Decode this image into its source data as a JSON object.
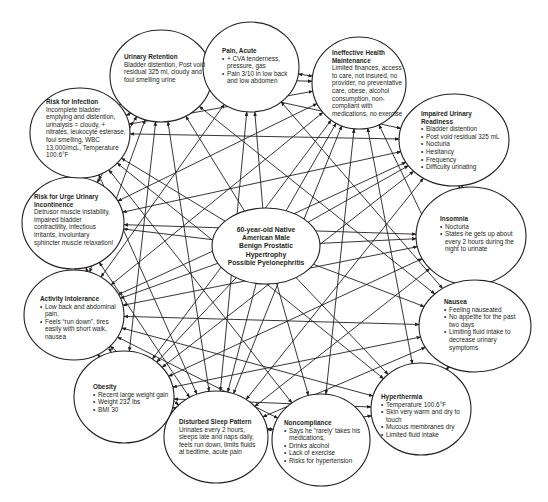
{
  "diagram": {
    "type": "concept-map",
    "center": {
      "lines": [
        "60-year-old Native",
        "American Male",
        "Benign Prostatic",
        "Hypertrophy",
        "Possible Pyelonephritis"
      ],
      "cx": 266,
      "cy": 246,
      "rx": 54,
      "ry": 38
    },
    "nodes": [
      {
        "id": "urinary-retention",
        "title": "Urinary Retention",
        "description": "Bladder distention, Post void residual 325 ml, cloudy and foul smelling urine",
        "bullets": [],
        "cx": 161,
        "cy": 76,
        "rx": 51,
        "ry": 46,
        "tx": 124,
        "ty": 53,
        "tw": 82
      },
      {
        "id": "pain-acute",
        "title": "Pain, Acute",
        "description": "",
        "bullets": [
          "+ CVA tenderness, pressure, gas",
          "Pain 3/10 in low back and low abdomen"
        ],
        "cx": 251,
        "cy": 67,
        "rx": 48,
        "ry": 45,
        "tx": 222,
        "ty": 47,
        "tw": 74
      },
      {
        "id": "ineffective-health-maintenance",
        "title": "Ineffective Health Maintenance",
        "description": "Limited finances, access to care, not insured, no provider, no preventative care, obese, alcohol consumption, non-compliant with medications, no exercise",
        "bullets": [],
        "cx": 359,
        "cy": 83,
        "rx": 47,
        "ry": 46,
        "tx": 332,
        "ty": 49,
        "tw": 76
      },
      {
        "id": "impaired-urinary-readiness",
        "title": "Impaired Urinary Readiness",
        "description": "",
        "bullets": [
          "Bladder distention",
          "Post void residual 325 mL",
          "Nocturia",
          "Hesitancy",
          "Frequency",
          "Difficulty urinating"
        ],
        "cx": 454,
        "cy": 140,
        "rx": 55,
        "ry": 46,
        "tx": 421,
        "ty": 110,
        "tw": 84
      },
      {
        "id": "insomnia",
        "title": "Insomnia",
        "description": "",
        "bullets": [
          "Nocturia",
          "States he gets up about every 2 hours during the night to urinate"
        ],
        "cx": 471,
        "cy": 236,
        "rx": 55,
        "ry": 49,
        "tx": 440,
        "ty": 215,
        "tw": 78
      },
      {
        "id": "nausea",
        "title": "Nausea",
        "description": "",
        "bullets": [
          "Feeling nauseated",
          "No appetite for the past two days",
          "Limiting fluid intake to decrease urinary symptoms"
        ],
        "cx": 475,
        "cy": 326,
        "rx": 56,
        "ry": 46,
        "tx": 444,
        "ty": 298,
        "tw": 76
      },
      {
        "id": "hyperthermia",
        "title": "Hyperthermia",
        "description": "",
        "bullets": [
          "Temperature 100.6°F",
          "Skin very warm and dry to touch",
          "Mucous membranes dry",
          "Limited fluid intake"
        ],
        "cx": 421,
        "cy": 409,
        "rx": 50,
        "ry": 46,
        "tx": 381,
        "ty": 393,
        "tw": 92
      },
      {
        "id": "noncompliance",
        "title": "Noncompliance",
        "description": "",
        "bullets": [
          "Says he “rarely’ takes his medications,",
          "Drinks alcohol",
          "Lack of exercise",
          "Risks for hypertension"
        ],
        "cx": 321,
        "cy": 440,
        "rx": 49,
        "ry": 46,
        "tx": 284,
        "ty": 419,
        "tw": 82
      },
      {
        "id": "disturbed-sleep-pattern",
        "title": "Disturbed Sleep Pattern",
        "description": "Urinates every 2 hours, sleeps late and naps daily, feels run down, limits fluids at bedtime, acute pain",
        "bullets": [],
        "cx": 216,
        "cy": 437,
        "rx": 52,
        "ry": 46,
        "tx": 179,
        "ty": 418,
        "tw": 80
      },
      {
        "id": "obesity",
        "title": "Obesity",
        "description": "",
        "bullets": [
          "Recent large weight gain",
          "Weight 232 lbs",
          "BMI 30"
        ],
        "cx": 124,
        "cy": 397,
        "rx": 50,
        "ry": 46,
        "tx": 93,
        "ty": 383,
        "tw": 76
      },
      {
        "id": "activity-intolerance",
        "title": "Activity Intolerance",
        "description": "",
        "bullets": [
          "Low back and abdominal pain,",
          "Feels “run down”, tires easily with short walk, nausea"
        ],
        "cx": 74,
        "cy": 315,
        "rx": 50,
        "ry": 45,
        "tx": 40,
        "ty": 295,
        "tw": 76
      },
      {
        "id": "risk-for-urge-urinary-incontinence",
        "title": "Risk for Urge Urinary Incontinence",
        "description": "Detrusor muscle instability, impaired bladder contractility, infectious irritants, involuntary sphincter muscle relaxation!",
        "bullets": [],
        "cx": 73,
        "cy": 223,
        "rx": 51,
        "ry": 46,
        "tx": 34,
        "ty": 193,
        "tw": 82
      },
      {
        "id": "risk-for-infection",
        "title": "Risk for Infection",
        "description": "Incomplete bladder emptying and distention, urinalysis = cloudy, + nitrates, leukocyte esterase, foul smelling, WBC 13,000/mcL, Temperature 100.6°F",
        "bullets": [],
        "cx": 80,
        "cy": 133,
        "rx": 50,
        "ry": 45,
        "tx": 46,
        "ty": 98,
        "tw": 80
      }
    ],
    "edges": [
      [
        "center",
        "urinary-retention"
      ],
      [
        "center",
        "pain-acute"
      ],
      [
        "center",
        "ineffective-health-maintenance"
      ],
      [
        "center",
        "impaired-urinary-readiness"
      ],
      [
        "center",
        "insomnia"
      ],
      [
        "center",
        "nausea"
      ],
      [
        "center",
        "hyperthermia"
      ],
      [
        "center",
        "noncompliance"
      ],
      [
        "center",
        "disturbed-sleep-pattern"
      ],
      [
        "center",
        "obesity"
      ],
      [
        "center",
        "activity-intolerance"
      ],
      [
        "center",
        "risk-for-urge-urinary-incontinence"
      ],
      [
        "center",
        "risk-for-infection"
      ],
      [
        "urinary-retention",
        "pain-acute"
      ],
      [
        "urinary-retention",
        "ineffective-health-maintenance"
      ],
      [
        "urinary-retention",
        "impaired-urinary-readiness"
      ],
      [
        "urinary-retention",
        "risk-for-infection"
      ],
      [
        "urinary-retention",
        "disturbed-sleep-pattern"
      ],
      [
        "urinary-retention",
        "activity-intolerance"
      ],
      [
        "urinary-retention",
        "nausea"
      ],
      [
        "urinary-retention",
        "obesity"
      ],
      [
        "urinary-retention",
        "risk-for-urge-urinary-incontinence"
      ],
      [
        "pain-acute",
        "ineffective-health-maintenance"
      ],
      [
        "pain-acute",
        "disturbed-sleep-pattern"
      ],
      [
        "pain-acute",
        "activity-intolerance"
      ],
      [
        "pain-acute",
        "nausea"
      ],
      [
        "pain-acute",
        "risk-for-infection"
      ],
      [
        "ineffective-health-maintenance",
        "risk-for-infection"
      ],
      [
        "ineffective-health-maintenance",
        "obesity"
      ],
      [
        "ineffective-health-maintenance",
        "noncompliance"
      ],
      [
        "ineffective-health-maintenance",
        "activity-intolerance"
      ],
      [
        "ineffective-health-maintenance",
        "disturbed-sleep-pattern"
      ],
      [
        "ineffective-health-maintenance",
        "risk-for-urge-urinary-incontinence"
      ],
      [
        "ineffective-health-maintenance",
        "nausea"
      ],
      [
        "ineffective-health-maintenance",
        "hyperthermia"
      ],
      [
        "impaired-urinary-readiness",
        "insomnia"
      ],
      [
        "impaired-urinary-readiness",
        "nausea"
      ],
      [
        "impaired-urinary-readiness",
        "risk-for-infection"
      ],
      [
        "impaired-urinary-readiness",
        "risk-for-urge-urinary-incontinence"
      ],
      [
        "impaired-urinary-readiness",
        "disturbed-sleep-pattern"
      ],
      [
        "impaired-urinary-readiness",
        "activity-intolerance"
      ],
      [
        "impaired-urinary-readiness",
        "obesity"
      ],
      [
        "insomnia",
        "disturbed-sleep-pattern"
      ],
      [
        "insomnia",
        "activity-intolerance"
      ],
      [
        "insomnia",
        "obesity"
      ],
      [
        "insomnia",
        "risk-for-urge-urinary-incontinence"
      ],
      [
        "nausea",
        "hyperthermia"
      ],
      [
        "nausea",
        "activity-intolerance"
      ],
      [
        "nausea",
        "disturbed-sleep-pattern"
      ],
      [
        "nausea",
        "obesity"
      ],
      [
        "hyperthermia",
        "risk-for-infection"
      ],
      [
        "hyperthermia",
        "disturbed-sleep-pattern"
      ],
      [
        "hyperthermia",
        "activity-intolerance"
      ],
      [
        "hyperthermia",
        "obesity"
      ],
      [
        "noncompliance",
        "activity-intolerance"
      ],
      [
        "noncompliance",
        "risk-for-infection"
      ],
      [
        "noncompliance",
        "obesity"
      ],
      [
        "disturbed-sleep-pattern",
        "activity-intolerance"
      ],
      [
        "disturbed-sleep-pattern",
        "risk-for-infection"
      ],
      [
        "disturbed-sleep-pattern",
        "risk-for-urge-urinary-incontinence"
      ],
      [
        "obesity",
        "activity-intolerance"
      ],
      [
        "obesity",
        "risk-for-urge-urinary-incontinence"
      ],
      [
        "activity-intolerance",
        "risk-for-infection"
      ]
    ],
    "colors": {
      "stroke": "#231f20",
      "text": "#231f20",
      "background": "#ffffff"
    }
  }
}
